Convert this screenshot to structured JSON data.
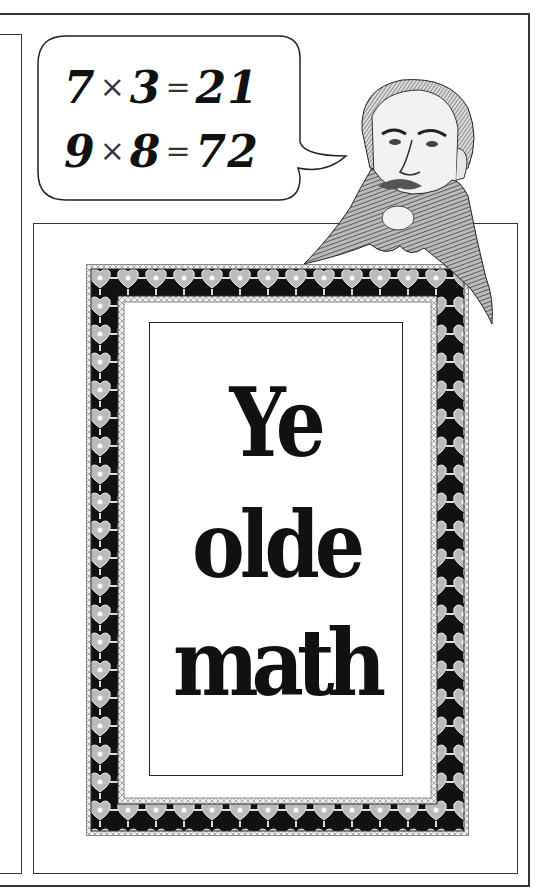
{
  "speech_bubble": {
    "lines": [
      {
        "a": "7",
        "op": "×",
        "b": "3",
        "eq": "=",
        "result": "21"
      },
      {
        "a": "9",
        "op": "×",
        "b": "8",
        "eq": "=",
        "result": "72"
      }
    ]
  },
  "title": {
    "lines": [
      "Ye",
      "olde",
      "math"
    ]
  },
  "portrait": {
    "subject": "bearded-man-engraving"
  },
  "colors": {
    "ink": "#111111",
    "frame_line": "#333333",
    "border_light": "#cccccc",
    "background": "#ffffff"
  }
}
